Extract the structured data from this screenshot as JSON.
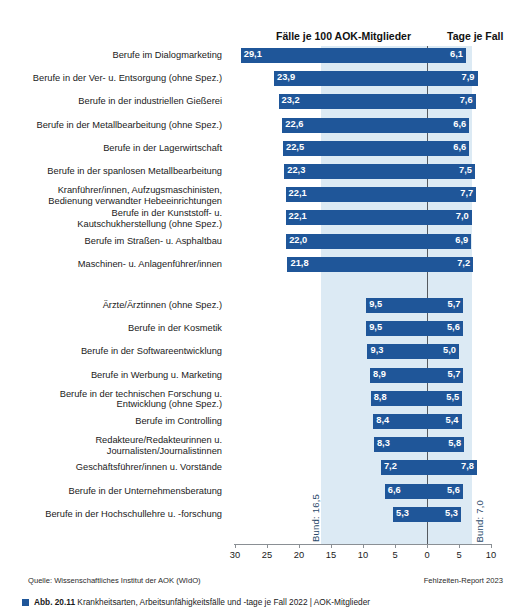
{
  "header": {
    "cases_title": "Fälle je 100 AOK-Mitglieder",
    "days_title": "Tage je Fall"
  },
  "annotations": {
    "bund_left": "Bund: 16,5",
    "bund_right": "Bund: 7,0"
  },
  "footer": {
    "source": "Quelle: Wissenschaftliches Institut der AOK (WIdO)",
    "report": "Fehlzeiten-Report 2023",
    "caption_bold": "Abb. 20.11",
    "caption_rest": "Krankheitsarten, Arbeitsunfähigkeitsfälle und -tage je Fall 2022 | AOK-Mitglieder"
  },
  "chart_data": {
    "type": "bar",
    "xlabel": "",
    "ylabel": "",
    "orientation": "horizontal",
    "grid": false,
    "legend": "none",
    "axis": {
      "ticks": [
        30,
        25,
        20,
        15,
        10,
        5,
        0,
        5,
        10
      ],
      "tick_labels": [
        "30",
        "25",
        "20",
        "15",
        "10",
        "5",
        "0",
        "5",
        "10"
      ],
      "zero_position_index": 6,
      "left_axis_max": 30,
      "right_axis_max": 10
    },
    "reference_lines": [
      {
        "name": "Bund (Fälle)",
        "value": 16.5,
        "side": "left",
        "label": "Bund: 16,5"
      },
      {
        "name": "Bund (Tage je Fall)",
        "value": 7.0,
        "side": "right",
        "label": "Bund: 7,0"
      }
    ],
    "series": [
      {
        "name": "Fälle je 100 AOK-Mitglieder",
        "side": "left"
      },
      {
        "name": "Tage je Fall",
        "side": "right"
      }
    ],
    "groups": [
      {
        "group": "top",
        "rows": [
          {
            "category": "Berufe im Dialogmarketing",
            "cases": 29.1,
            "days": 6.1,
            "cases_label": "29,1",
            "days_label": "6,1"
          },
          {
            "category": "Berufe in der Ver- u. Entsorgung (ohne Spez.)",
            "cases": 23.9,
            "days": 7.9,
            "cases_label": "23,9",
            "days_label": "7,9"
          },
          {
            "category": "Berufe in der industriellen Gießerei",
            "cases": 23.2,
            "days": 7.6,
            "cases_label": "23,2",
            "days_label": "7,6"
          },
          {
            "category": "Berufe in der Metallbearbeitung (ohne Spez.)",
            "cases": 22.6,
            "days": 6.6,
            "cases_label": "22,6",
            "days_label": "6,6"
          },
          {
            "category": "Berufe in der Lagerwirtschaft",
            "cases": 22.5,
            "days": 6.6,
            "cases_label": "22,5",
            "days_label": "6,6"
          },
          {
            "category": "Berufe in der spanlosen Metallbearbeitung",
            "cases": 22.3,
            "days": 7.5,
            "cases_label": "22,3",
            "days_label": "7,5"
          },
          {
            "category": "Kranführer/innen, Aufzugsmaschinisten,\nBedienung verwandter Hebeeinrichtungen",
            "cases": 22.1,
            "days": 7.7,
            "cases_label": "22,1",
            "days_label": "7,7"
          },
          {
            "category": "Berufe in der Kunststoff- u.\nKautschukherstellung (ohne Spez.)",
            "cases": 22.1,
            "days": 7.0,
            "cases_label": "22,1",
            "days_label": "7,0"
          },
          {
            "category": "Berufe im Straßen- u. Asphaltbau",
            "cases": 22.0,
            "days": 6.9,
            "cases_label": "22,0",
            "days_label": "6,9"
          },
          {
            "category": "Maschinen- u. Anlagenführer/innen",
            "cases": 21.8,
            "days": 7.2,
            "cases_label": "21,8",
            "days_label": "7,2"
          }
        ]
      },
      {
        "group": "bottom",
        "rows": [
          {
            "category": "Ärzte/Ärztinnen (ohne Spez.)",
            "cases": 9.5,
            "days": 5.7,
            "cases_label": "9,5",
            "days_label": "5,7"
          },
          {
            "category": "Berufe in der Kosmetik",
            "cases": 9.5,
            "days": 5.6,
            "cases_label": "9,5",
            "days_label": "5,6"
          },
          {
            "category": "Berufe in der Softwareentwicklung",
            "cases": 9.3,
            "days": 5.0,
            "cases_label": "9,3",
            "days_label": "5,0"
          },
          {
            "category": "Berufe in Werbung u. Marketing",
            "cases": 8.9,
            "days": 5.7,
            "cases_label": "8,9",
            "days_label": "5,7"
          },
          {
            "category": "Berufe in der technischen Forschung u.\nEntwicklung (ohne Spez.)",
            "cases": 8.8,
            "days": 5.5,
            "cases_label": "8,8",
            "days_label": "5,5"
          },
          {
            "category": "Berufe im Controlling",
            "cases": 8.4,
            "days": 5.4,
            "cases_label": "8,4",
            "days_label": "5,4"
          },
          {
            "category": "Redakteure/Redakteurinnen u.\nJournalisten/Journalistinnen",
            "cases": 8.3,
            "days": 5.8,
            "cases_label": "8,3",
            "days_label": "5,8"
          },
          {
            "category": "Geschäftsführer/innen u. Vorstände",
            "cases": 7.2,
            "days": 7.8,
            "cases_label": "7,2",
            "days_label": "7,8"
          },
          {
            "category": "Berufe in der Unternehmensberatung",
            "cases": 6.6,
            "days": 5.6,
            "cases_label": "6,6",
            "days_label": "5,6"
          },
          {
            "category": "Berufe in der Hochschullehre u. -forschung",
            "cases": 5.3,
            "days": 5.3,
            "cases_label": "5,3",
            "days_label": "5,3"
          }
        ]
      }
    ]
  },
  "colors": {
    "bar": "#1f5699",
    "band": "#dceaf4",
    "zero_line": "#555a60",
    "text": "#1a1a1a"
  }
}
